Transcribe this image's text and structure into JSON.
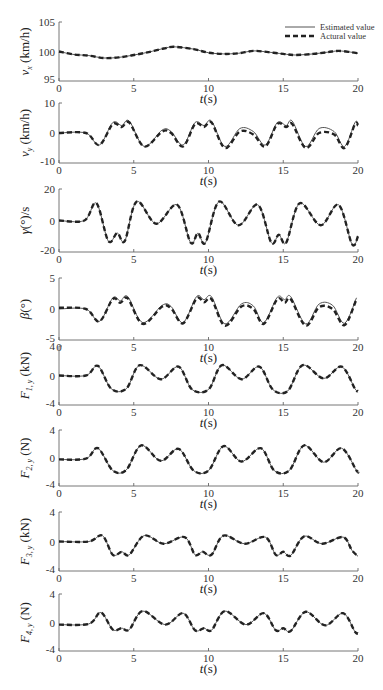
{
  "legend": {
    "estimated": "Estimated value",
    "actual": "Actural value"
  },
  "colors": {
    "estimated": "#555555",
    "actual": "#222222",
    "axis": "#666666"
  },
  "chart_data": [
    {
      "type": "line",
      "ylabel": "v_x (km/h)",
      "ylabel_main": "v",
      "ylabel_sub": "x",
      "ylabel_unit": " (km/h)",
      "xlabel": "t(s)",
      "xlim": [
        0,
        20
      ],
      "ylim": [
        95,
        105
      ],
      "yticks": [
        95,
        100,
        105
      ],
      "xticks": [
        0,
        5,
        10,
        15,
        20
      ],
      "series": [
        {
          "name": "Estimated value",
          "x": [
            0,
            1,
            2,
            3,
            4,
            5,
            6,
            7,
            7.7,
            9,
            10,
            11,
            12,
            13,
            14,
            15,
            15.8,
            17,
            18,
            18.7,
            19.5,
            20
          ],
          "values": [
            100,
            99.5,
            99.3,
            98.9,
            99,
            99.4,
            99.9,
            100.5,
            100.8,
            100.4,
            99.8,
            99.6,
            99.7,
            100.1,
            99.9,
            99.6,
            99.4,
            99.6,
            99.9,
            100.1,
            99.9,
            99.7
          ]
        },
        {
          "name": "Actural value",
          "x": [
            0,
            1,
            2,
            3,
            4,
            5,
            6,
            7,
            7.7,
            9,
            10,
            11,
            12,
            13,
            14,
            15,
            15.8,
            17,
            18,
            18.7,
            19.5,
            20
          ],
          "values": [
            100,
            99.5,
            99.3,
            98.9,
            99,
            99.4,
            99.9,
            100.5,
            100.8,
            100.4,
            99.8,
            99.6,
            99.7,
            100.1,
            99.9,
            99.6,
            99.4,
            99.6,
            99.9,
            100.1,
            99.9,
            99.7
          ]
        }
      ]
    },
    {
      "type": "line",
      "ylabel": "v_y (km/h)",
      "ylabel_main": "v",
      "ylabel_sub": "y",
      "ylabel_unit": " (km/h)",
      "xlabel": "t(s)",
      "xlim": [
        0,
        20
      ],
      "ylim": [
        -10,
        10
      ],
      "yticks": [
        -10,
        0,
        10
      ],
      "xticks": [
        0,
        5,
        10,
        15,
        20
      ],
      "series": [
        {
          "name": "Estimated value",
          "x": [
            0,
            1.8,
            2.7,
            3.6,
            4.2,
            4.7,
            5.7,
            6.9,
            7.5,
            8.3,
            9.1,
            9.7,
            10.2,
            11.1,
            12.1,
            13,
            13.8,
            14.6,
            15.2,
            15.6,
            16.5,
            17.4,
            18.4,
            19.1,
            19.8,
            20
          ],
          "values": [
            0,
            0,
            -4,
            3.5,
            2.5,
            4,
            -4.5,
            1,
            0.5,
            -4,
            3.5,
            2.5,
            4,
            -4.5,
            1.5,
            0.5,
            -4,
            3.5,
            2.5,
            4,
            -4.5,
            1.5,
            0.5,
            -4.5,
            3.5,
            3
          ]
        },
        {
          "name": "Actural value",
          "x": [
            0,
            1.8,
            2.7,
            3.6,
            4.2,
            4.7,
            5.7,
            6.9,
            7.5,
            8.3,
            9.1,
            9.7,
            10.2,
            11.1,
            12.1,
            13,
            13.8,
            14.6,
            15.2,
            15.6,
            16.5,
            17.4,
            18.4,
            19.1,
            19.8,
            20
          ],
          "values": [
            0,
            0,
            -4,
            3,
            2,
            3.5,
            -4.5,
            0.5,
            0,
            -4.5,
            3,
            2,
            3.5,
            -5,
            0.5,
            -0.5,
            -4.5,
            3,
            2,
            3,
            -5,
            0,
            -0.5,
            -5,
            3,
            2.5
          ]
        }
      ]
    },
    {
      "type": "line",
      "ylabel": "γ(°)/s",
      "ylabel_main": "γ",
      "ylabel_sub": "",
      "ylabel_unit": "(°)/s",
      "xlabel": "t(s)",
      "xlim": [
        0,
        20
      ],
      "ylim": [
        -20,
        20
      ],
      "yticks": [
        -20,
        0,
        20
      ],
      "xticks": [
        0,
        5,
        10,
        15,
        20
      ],
      "series": [
        {
          "name": "Estimated value",
          "x": [
            0,
            1.7,
            2.5,
            3.3,
            3.9,
            4.4,
            5.2,
            6.5,
            7.9,
            8.8,
            9.3,
            9.8,
            10.7,
            12,
            13.3,
            14.2,
            14.7,
            15.2,
            16.1,
            17.5,
            18.7,
            19.6,
            20
          ],
          "values": [
            0,
            0,
            11,
            -13,
            -8,
            -13,
            12,
            -2,
            10,
            -14,
            -8,
            -14,
            12,
            -3,
            10,
            -14,
            -9,
            -14,
            11,
            -3,
            10,
            -15,
            -10
          ]
        },
        {
          "name": "Actural value",
          "x": [
            0,
            1.7,
            2.5,
            3.3,
            3.9,
            4.4,
            5.2,
            6.5,
            7.9,
            8.8,
            9.3,
            9.8,
            10.7,
            12,
            13.3,
            14.2,
            14.7,
            15.2,
            16.1,
            17.5,
            18.7,
            19.6,
            20
          ],
          "values": [
            0,
            0,
            11,
            -13,
            -8,
            -13,
            12,
            -2,
            10,
            -14,
            -8,
            -14,
            12,
            -3,
            10,
            -14,
            -9,
            -14,
            11,
            -3,
            10,
            -15,
            -10
          ]
        }
      ]
    },
    {
      "type": "line",
      "ylabel": "β(°)",
      "ylabel_main": "β",
      "ylabel_sub": "",
      "ylabel_unit": "(°)",
      "xlabel": "t(s)",
      "xlim": [
        0,
        20
      ],
      "ylim": [
        -5,
        5
      ],
      "yticks": [
        -5,
        0,
        5
      ],
      "xticks": [
        0,
        5,
        10,
        15,
        20
      ],
      "series": [
        {
          "name": "Estimated value",
          "x": [
            0,
            1.8,
            2.7,
            3.6,
            4.1,
            4.6,
            5.6,
            6.9,
            7.5,
            8.3,
            9.2,
            9.7,
            10.2,
            11.1,
            12.2,
            13,
            13.7,
            14.6,
            15.1,
            15.5,
            16.5,
            17.4,
            18.3,
            19.1,
            19.9
          ],
          "values": [
            0,
            0,
            -2,
            1.8,
            1.3,
            2,
            -2.2,
            0.6,
            0.4,
            -2.2,
            2,
            1.5,
            2,
            -2.4,
            0.8,
            0.5,
            -2.2,
            1.9,
            1.5,
            2,
            -2.4,
            0.8,
            0.6,
            -2.3,
            1.8
          ]
        },
        {
          "name": "Actural value",
          "x": [
            0,
            1.8,
            2.7,
            3.6,
            4.1,
            4.6,
            5.6,
            6.9,
            7.5,
            8.3,
            9.2,
            9.7,
            10.2,
            11.1,
            12.2,
            13,
            13.7,
            14.6,
            15.1,
            15.5,
            16.5,
            17.4,
            18.3,
            19.1,
            19.9
          ],
          "values": [
            0.2,
            0,
            -2,
            1.6,
            1,
            1.7,
            -2.4,
            0.4,
            0.1,
            -2.3,
            1.7,
            1.1,
            1.6,
            -2.7,
            0.4,
            0,
            -2.4,
            1.6,
            1,
            1.6,
            -2.7,
            0.3,
            0,
            -2.6,
            1.6
          ]
        }
      ]
    },
    {
      "type": "line",
      "ylabel": "F_1,y (kN)",
      "ylabel_main": "F",
      "ylabel_sub": "1, y",
      "ylabel_unit": " (kN)",
      "xlabel": "t(s)",
      "xlim": [
        0,
        20
      ],
      "ylim": [
        -4,
        4
      ],
      "yticks": [
        -4,
        0,
        4
      ],
      "xticks": [
        0,
        5,
        10,
        15,
        20
      ],
      "series": [
        {
          "name": "Estimated value",
          "x": [
            0,
            1.8,
            2.6,
            3.5,
            4.5,
            5.4,
            6.8,
            8,
            8.9,
            10,
            10.9,
            12.2,
            13.4,
            14.3,
            15.3,
            16.3,
            17.7,
            18.9,
            19.8,
            20
          ],
          "values": [
            0,
            0,
            1.3,
            -1.8,
            -1.8,
            1.4,
            -0.5,
            1.2,
            -1.9,
            -1.9,
            1.4,
            -0.5,
            1.2,
            -1.9,
            -2.1,
            1.4,
            -0.4,
            1.2,
            -1.8,
            -2.1
          ]
        },
        {
          "name": "Actural value",
          "x": [
            0,
            1.8,
            2.6,
            3.5,
            4.5,
            5.4,
            6.8,
            8,
            8.9,
            10,
            10.9,
            12.2,
            13.4,
            14.3,
            15.3,
            16.3,
            17.7,
            18.9,
            19.8,
            20
          ],
          "values": [
            0,
            0,
            1.3,
            -1.8,
            -1.8,
            1.4,
            -0.5,
            1.2,
            -1.9,
            -1.9,
            1.4,
            -0.5,
            1.2,
            -1.9,
            -2.1,
            1.4,
            -0.4,
            1.2,
            -1.8,
            -2.1
          ]
        }
      ]
    },
    {
      "type": "line",
      "ylabel": "F_2,y (N)",
      "ylabel_main": "F",
      "ylabel_sub": "2, y",
      "ylabel_unit": " (N)",
      "xlabel": "t(s)",
      "xlim": [
        0,
        20
      ],
      "ylim": [
        -4,
        4
      ],
      "yticks": [
        -4,
        0,
        4
      ],
      "xticks": [
        0,
        5,
        10,
        15,
        20
      ],
      "series": [
        {
          "name": "Estimated value",
          "x": [
            0,
            1.8,
            2.6,
            3.6,
            4.5,
            5.5,
            6.8,
            8,
            9,
            10,
            11,
            12.2,
            13.5,
            14.4,
            15.4,
            16.4,
            17.7,
            18.9,
            19.9,
            20
          ],
          "values": [
            -0.2,
            -0.1,
            1.4,
            -1.8,
            -1.7,
            1.8,
            -0.4,
            1.3,
            -1.8,
            -1.8,
            1.7,
            -0.5,
            1.4,
            -1.8,
            -1.8,
            1.8,
            -0.6,
            1.4,
            -1.8,
            -1.9
          ]
        },
        {
          "name": "Actural value",
          "x": [
            0,
            1.8,
            2.6,
            3.6,
            4.5,
            5.5,
            6.8,
            8,
            9,
            10,
            11,
            12.2,
            13.5,
            14.4,
            15.4,
            16.4,
            17.7,
            18.9,
            19.9,
            20
          ],
          "values": [
            -0.2,
            -0.1,
            1.4,
            -1.8,
            -1.7,
            1.8,
            -0.4,
            1.3,
            -1.8,
            -1.8,
            1.7,
            -0.5,
            1.4,
            -1.8,
            -1.8,
            1.8,
            -0.6,
            1.4,
            -1.8,
            -1.9
          ]
        }
      ]
    },
    {
      "type": "line",
      "ylabel": "F_3,y (kN)",
      "ylabel_main": "F",
      "ylabel_sub": "3, y",
      "ylabel_unit": " (kN)",
      "xlabel": "t(s)",
      "xlim": [
        0,
        20
      ],
      "ylim": [
        -4,
        4
      ],
      "yticks": [
        -4,
        0,
        4
      ],
      "xticks": [
        0,
        5,
        10,
        15,
        20
      ],
      "series": [
        {
          "name": "Estimated value",
          "x": [
            0,
            2,
            2.9,
            3.6,
            4.2,
            4.7,
            5.7,
            7,
            8.4,
            9.1,
            9.6,
            10.2,
            11,
            12.4,
            13.8,
            14.5,
            15,
            15.5,
            16.4,
            17.6,
            19,
            19.6,
            20
          ],
          "values": [
            0,
            0,
            0.8,
            -1.8,
            -1.4,
            -1.8,
            0.8,
            -0.3,
            0.6,
            -1.8,
            -1.4,
            -1.8,
            0.8,
            -0.3,
            0.6,
            -1.8,
            -1.4,
            -1.9,
            0.7,
            -0.3,
            0.6,
            -1.2,
            -2
          ]
        },
        {
          "name": "Actural value",
          "x": [
            0,
            2,
            2.9,
            3.6,
            4.2,
            4.7,
            5.7,
            7,
            8.4,
            9.1,
            9.6,
            10.2,
            11,
            12.4,
            13.8,
            14.5,
            15,
            15.5,
            16.4,
            17.6,
            19,
            19.6,
            20
          ],
          "values": [
            0,
            0,
            0.8,
            -1.8,
            -1.4,
            -1.8,
            0.8,
            -0.3,
            0.6,
            -1.8,
            -1.4,
            -1.8,
            0.8,
            -0.3,
            0.6,
            -1.8,
            -1.4,
            -1.9,
            0.7,
            -0.3,
            0.6,
            -1.2,
            -2
          ]
        }
      ]
    },
    {
      "type": "line",
      "ylabel": "F_4,y (N)",
      "ylabel_main": "F",
      "ylabel_sub": "4, y",
      "ylabel_unit": " (N)",
      "xlabel": "t(s)",
      "xlim": [
        0,
        20
      ],
      "ylim": [
        -4,
        4
      ],
      "yticks": [
        -4,
        0,
        4
      ],
      "xticks": [
        0,
        5,
        10,
        15,
        20
      ],
      "series": [
        {
          "name": "Estimated value",
          "x": [
            0,
            2,
            2.8,
            3.6,
            4.2,
            4.7,
            5.6,
            7.1,
            8.3,
            9.1,
            9.7,
            10.2,
            11.1,
            12.5,
            13.7,
            14.5,
            15,
            15.5,
            16.5,
            17.8,
            19,
            19.8,
            20
          ],
          "values": [
            -0.3,
            -0.2,
            1.4,
            -1,
            -0.8,
            -1,
            1.6,
            -0.3,
            1.3,
            -1.1,
            -0.8,
            -1.1,
            1.6,
            -0.3,
            1.3,
            -1.1,
            -0.8,
            -1.2,
            1.5,
            -0.4,
            1.3,
            -1.3,
            -1.5
          ]
        },
        {
          "name": "Actural value",
          "x": [
            0,
            2,
            2.8,
            3.6,
            4.2,
            4.7,
            5.6,
            7.1,
            8.3,
            9.1,
            9.7,
            10.2,
            11.1,
            12.5,
            13.7,
            14.5,
            15,
            15.5,
            16.5,
            17.8,
            19,
            19.8,
            20
          ],
          "values": [
            -0.3,
            -0.2,
            1.4,
            -1,
            -0.8,
            -1,
            1.6,
            -0.3,
            1.3,
            -1.1,
            -0.8,
            -1.1,
            1.6,
            -0.3,
            1.3,
            -1.1,
            -0.8,
            -1.2,
            1.5,
            -0.4,
            1.3,
            -1.3,
            -1.5
          ]
        }
      ]
    }
  ]
}
